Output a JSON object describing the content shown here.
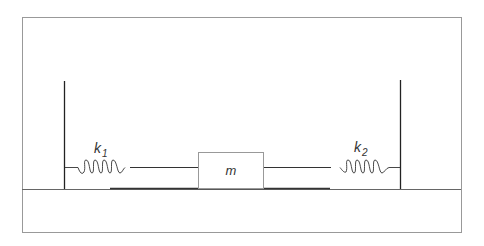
{
  "diagram": {
    "title": "",
    "mass_label": "m",
    "spring_left": {
      "label": "k",
      "subscript": "1"
    },
    "spring_right": {
      "label": "k",
      "subscript": "2"
    },
    "colors": {
      "line": "#333333",
      "frame": "#888888",
      "background": "#ffffff"
    }
  }
}
